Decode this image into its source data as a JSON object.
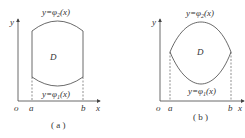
{
  "figure_a": {
    "caption": "( a )",
    "upper_curve_label": "y=φ",
    "upper_curve_sub": "2",
    "upper_curve_arg": "(x)",
    "lower_curve_label": "y=φ",
    "lower_curve_sub": "1",
    "lower_curve_arg": "(x)",
    "region_label": "D",
    "origin": "o",
    "x_axis": "x",
    "y_axis": "y",
    "a": "a",
    "b": "b"
  },
  "figure_b": {
    "caption": "( b )",
    "upper_curve_label": "y=φ",
    "upper_curve_sub": "2",
    "upper_curve_arg": "(x)",
    "lower_curve_label": "y=φ",
    "lower_curve_sub": "1",
    "lower_curve_arg": "(x)",
    "region_label": "D",
    "origin": "o",
    "x_axis": "x",
    "y_axis": "y",
    "a": "a",
    "b": "b"
  },
  "colors": {
    "stroke": "#444444",
    "text": "#333333"
  }
}
